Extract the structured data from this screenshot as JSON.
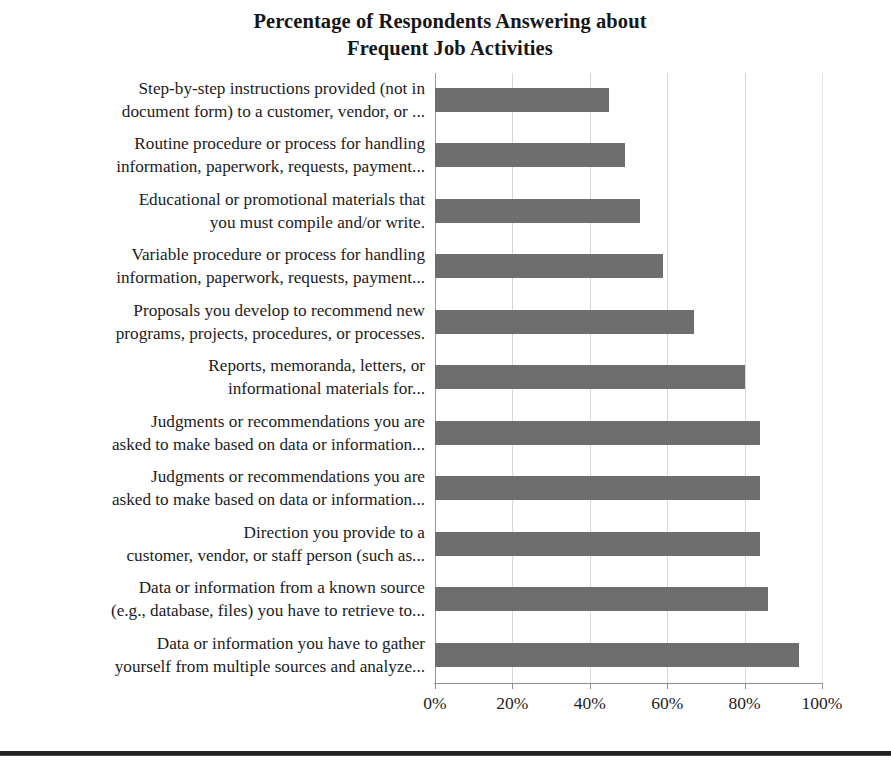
{
  "chart_data": {
    "type": "bar",
    "orientation": "horizontal",
    "title": "Percentage of Respondents Answering about Frequent Job Activities",
    "title_lines": [
      "Percentage of Respondents Answering about",
      "Frequent Job Activities"
    ],
    "xlabel": "",
    "ylabel": "",
    "xlim": [
      0,
      100
    ],
    "xticks": [
      0,
      20,
      40,
      60,
      80,
      100
    ],
    "xtick_labels": [
      "0%",
      "20%",
      "40%",
      "60%",
      "80%",
      "100%"
    ],
    "grid": true,
    "grid_axis": "x",
    "legend": false,
    "bar_color": "#6e6e6e",
    "categories": [
      "Step-by-step instructions provided (not in document form) to a customer, vendor, or ...",
      "Routine procedure or process for handling information, paperwork, requests, payment...",
      "Educational or promotional materials that you must compile and/or write.",
      "Variable procedure or process for handling information, paperwork, requests, payment...",
      "Proposals you develop to recommend new programs, projects, procedures, or processes.",
      "Reports, memoranda, letters, or informational materials for...",
      "Judgments or recommendations you are asked to make based on data or information...",
      "Judgments or recommendations you are asked to make based on data or information...",
      "Direction you provide to a customer, vendor, or staff person (such as...",
      "Data or information from a known source (e.g., database, files) you have to retrieve to...",
      "Data or information you have to gather yourself from multiple sources and analyze..."
    ],
    "category_lines": [
      [
        "Step-by-step instructions provided (not in",
        "document form) to a customer, vendor, or ..."
      ],
      [
        "Routine procedure or process for handling",
        "information, paperwork, requests, payment..."
      ],
      [
        "Educational or promotional materials that",
        "you must compile and/or write."
      ],
      [
        "Variable procedure or process for handling",
        "information, paperwork, requests, payment..."
      ],
      [
        "Proposals you develop to recommend new",
        "programs, projects, procedures, or processes."
      ],
      [
        "Reports, memoranda, letters, or",
        "informational materials for..."
      ],
      [
        "Judgments or recommendations you are",
        "asked to make based on data or information..."
      ],
      [
        "Judgments or recommendations you are",
        "asked to make based on data or information..."
      ],
      [
        "Direction you provide to a",
        "customer, vendor, or staff person (such as..."
      ],
      [
        "Data or information from a known source",
        "(e.g., database, files) you have to retrieve to..."
      ],
      [
        "Data or information you have to gather",
        "yourself from multiple sources and analyze..."
      ]
    ],
    "values": [
      45,
      49,
      53,
      59,
      67,
      80,
      84,
      84,
      84,
      86,
      94
    ],
    "value_unit": "%"
  }
}
